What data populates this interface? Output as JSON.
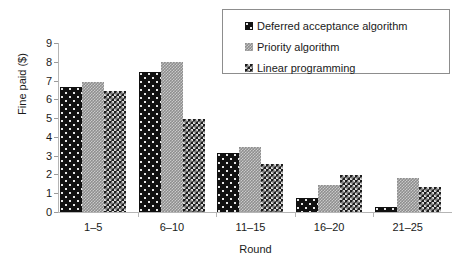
{
  "chart_data": {
    "type": "bar",
    "title": "",
    "subtitle": "",
    "xlabel": "Round",
    "ylabel": "Fine paid ($)",
    "categories": [
      "1–5",
      "6–10",
      "11–15",
      "16–20",
      "21–25"
    ],
    "ylim": [
      0,
      9
    ],
    "yticks": [
      "0",
      "1",
      "2",
      "3",
      "4",
      "5",
      "6",
      "7",
      "8",
      "9"
    ],
    "grid": false,
    "legend_position": "top-right",
    "series": [
      {
        "name": "Deferred acceptance algorithm",
        "pattern": "dots",
        "color": "#111111",
        "values": [
          6.65,
          7.45,
          3.15,
          0.75,
          0.25
        ]
      },
      {
        "name": "Priority algorithm",
        "pattern": "fine-check",
        "color": "#8e8e8e",
        "values": [
          6.95,
          8.0,
          3.45,
          1.45,
          1.8
        ]
      },
      {
        "name": "Linear programming",
        "pattern": "checkerboard",
        "color": "#1c1c1c",
        "values": [
          6.45,
          4.95,
          2.55,
          1.95,
          1.35
        ]
      }
    ]
  },
  "axes": {
    "y_label": "Fine paid ($)",
    "x_label": "Round"
  }
}
